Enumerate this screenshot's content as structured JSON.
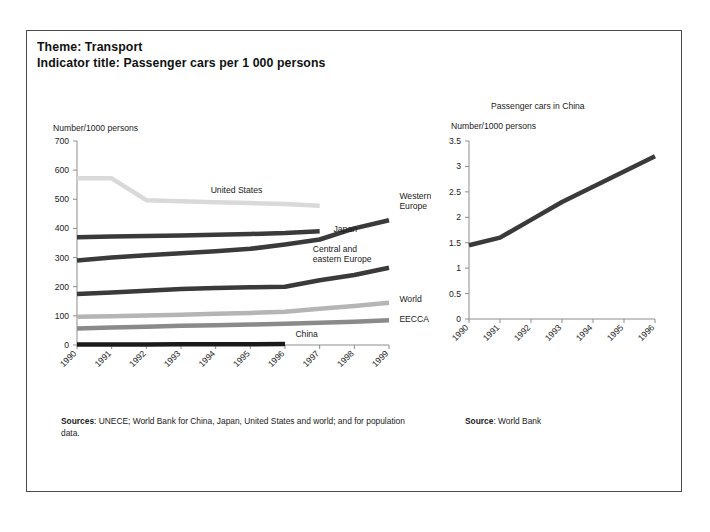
{
  "header": {
    "theme_line": "Theme: Transport",
    "indicator_line": "Indicator title: Passenger cars per 1 000 persons"
  },
  "sources": {
    "left_label": "Sources",
    "left_text": ": UNECE; World Bank for China, Japan, United States and world; and for population data.",
    "right_label": "Source",
    "right_text": ": World Bank"
  },
  "colors": {
    "axis": "#8d8d8d",
    "text": "#1a1a1a",
    "border": "#4a4a4a",
    "united_states": "#d9d9d9",
    "western_europe": "#3a3a3a",
    "japan": "#3a3a3a",
    "central_eastern_europe": "#3a3a3a",
    "world": "#b5b5b5",
    "eecca": "#8a8a8a",
    "china": "#1a1a1a",
    "china_chart_line": "#3a3a3a"
  },
  "chart_data": [
    {
      "id": "passenger-cars-main",
      "type": "line",
      "title": "",
      "ylabel": "Number/1000 persons",
      "xlabel": "",
      "ylim": [
        0,
        700
      ],
      "yticks": [
        0,
        100,
        200,
        300,
        400,
        500,
        600,
        700
      ],
      "ytick_labels": [
        "0",
        "100",
        "200",
        "300",
        "400",
        "500",
        "600",
        "700"
      ],
      "x": [
        1990,
        1991,
        1992,
        1993,
        1994,
        1995,
        1996,
        1997,
        1998,
        1999
      ],
      "xtick_labels": [
        "1990",
        "1991",
        "1992",
        "1993",
        "1994",
        "1995",
        "1996",
        "1997",
        "1998",
        "1999"
      ],
      "grid": false,
      "legend": "inline-labels",
      "series": [
        {
          "name": "United States",
          "color": "#d9d9d9",
          "width": 4.5,
          "label_x": 1994.6,
          "label_y": 520,
          "label_anchor": "middle",
          "values": [
            572,
            572,
            497,
            493,
            490,
            487,
            484,
            478,
            null,
            null
          ]
        },
        {
          "name": "Western Europe",
          "color": "#3a3a3a",
          "width": 4.5,
          "label_x": 1999.3,
          "label_y": 500,
          "label_anchor": "start",
          "label_lines": [
            "Western",
            "Europe"
          ],
          "values": [
            290,
            300,
            308,
            315,
            322,
            330,
            345,
            362,
            400,
            428
          ]
        },
        {
          "name": "Japan",
          "color": "#3a3a3a",
          "width": 4.5,
          "label_x": 1997.4,
          "label_y": 388,
          "label_anchor": "start",
          "values": [
            370,
            372,
            374,
            376,
            378,
            381,
            384,
            390,
            null,
            null
          ]
        },
        {
          "name": "Central and eastern Europe",
          "color": "#3a3a3a",
          "width": 4.5,
          "label_x": 1996.8,
          "label_y": 320,
          "label_anchor": "start",
          "label_lines": [
            "Central and",
            "eastern Europe"
          ],
          "values": [
            175,
            180,
            186,
            192,
            196,
            198,
            200,
            222,
            240,
            265
          ]
        },
        {
          "name": "World",
          "color": "#b5b5b5",
          "width": 4.5,
          "label_x": 1999.3,
          "label_y": 148,
          "label_anchor": "start",
          "values": [
            97,
            99,
            101,
            104,
            107,
            110,
            114,
            124,
            134,
            145
          ]
        },
        {
          "name": "EECCA",
          "color": "#8a8a8a",
          "width": 4.5,
          "label_x": 1999.3,
          "label_y": 80,
          "label_anchor": "start",
          "values": [
            57,
            60,
            63,
            66,
            68,
            70,
            73,
            76,
            80,
            85
          ]
        },
        {
          "name": "China",
          "color": "#1a1a1a",
          "width": 4.5,
          "label_x": 1996.3,
          "label_y": 28,
          "label_anchor": "start",
          "values": [
            1.45,
            1.6,
            1.95,
            2.3,
            2.6,
            2.9,
            3.2,
            null,
            null,
            null
          ]
        }
      ]
    },
    {
      "id": "passenger-cars-china",
      "type": "line",
      "title": "Passenger cars in China",
      "ylabel": "Number/1000 persons",
      "xlabel": "",
      "ylim": [
        0,
        3.5
      ],
      "yticks": [
        0,
        0.5,
        1,
        1.5,
        2,
        2.5,
        3,
        3.5
      ],
      "ytick_labels": [
        "0",
        "0.5",
        "1",
        "1.5",
        "2",
        "2.5",
        "3",
        "3.5"
      ],
      "x": [
        1990,
        1991,
        1992,
        1993,
        1994,
        1995,
        1996
      ],
      "xtick_labels": [
        "1990",
        "1991",
        "1992",
        "1993",
        "1994",
        "1995",
        "1996"
      ],
      "grid": false,
      "legend": "none",
      "series": [
        {
          "name": "China",
          "color": "#3a3a3a",
          "width": 4.5,
          "values": [
            1.45,
            1.6,
            1.95,
            2.3,
            2.6,
            2.9,
            3.2
          ]
        }
      ]
    }
  ]
}
